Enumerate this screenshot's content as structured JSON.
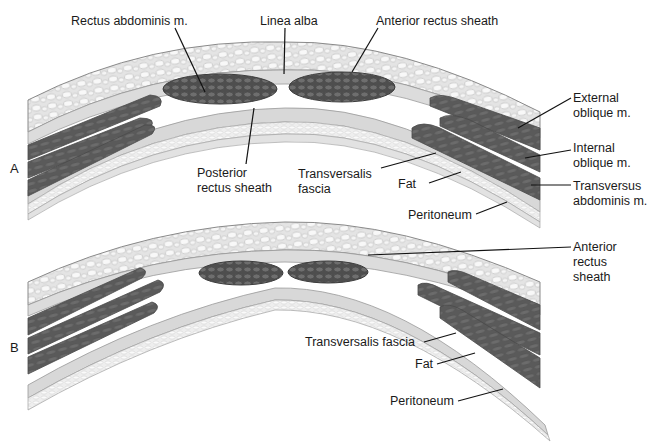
{
  "figure": {
    "panels": [
      {
        "id": "A",
        "letter": "A",
        "labels": {
          "rectus_abdominis": "Rectus abdominis m.",
          "linea_alba": "Linea alba",
          "anterior_rectus_sheath": "Anterior rectus sheath",
          "posterior_rectus_sheath": "Posterior\nrectus sheath",
          "transversalis_fascia": "Transversalis\nfascia",
          "fat": "Fat",
          "peritoneum": "Peritoneum",
          "external_oblique": "External\noblique m.",
          "internal_oblique": "Internal\noblique m.",
          "transversus_abdominis": "Transversus\nabdominis m."
        }
      },
      {
        "id": "B",
        "letter": "B",
        "labels": {
          "anterior_rectus_sheath": "Anterior\nrectus\nsheath",
          "transversalis_fascia": "Transversalis fascia",
          "fat": "Fat",
          "peritoneum": "Peritoneum"
        }
      }
    ],
    "colors": {
      "background": "#ffffff",
      "fat_fill": "#e6e6e6",
      "fat_lobule": "#f7f7f7",
      "fascia": "#d4d4d4",
      "muscle": "#5e5e5e",
      "muscle_dark": "#454545",
      "outline": "#7a7a7a",
      "leader": "#111111"
    }
  }
}
